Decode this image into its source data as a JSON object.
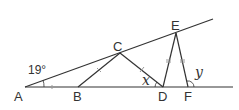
{
  "diagram": {
    "type": "geometry",
    "points": {
      "A": {
        "label": "A"
      },
      "B": {
        "label": "B"
      },
      "C": {
        "label": "C"
      },
      "D": {
        "label": "D"
      },
      "E": {
        "label": "E"
      },
      "F": {
        "label": "F"
      }
    },
    "angles": {
      "given": "19°",
      "unknown_x": "x",
      "unknown_y": "y"
    },
    "segments": [
      "AB",
      "BC",
      "CD",
      "DE",
      "EF",
      "A-C-E line",
      "A-B-D-F line"
    ],
    "equal_marks": {
      "single_tick": [
        "AB",
        "BC",
        "CD"
      ],
      "double_tick": [
        "DE",
        "EF"
      ]
    },
    "colors": {
      "stroke": "#333333",
      "tick": "#999999"
    }
  }
}
